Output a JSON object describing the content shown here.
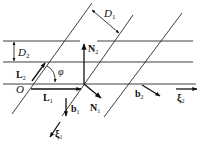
{
  "diagram": {
    "type": "geometric-vector-diagram",
    "labels": {
      "D1": {
        "main": "D",
        "sub": "1"
      },
      "D2": {
        "main": "D",
        "sub": "2"
      },
      "L1": {
        "main": "L",
        "sub": "1"
      },
      "L2": {
        "main": "L",
        "sub": "2"
      },
      "N1": {
        "main": "N",
        "sub": "1"
      },
      "N2": {
        "main": "N",
        "sub": "2"
      },
      "b1": {
        "main": "b",
        "sub": "1"
      },
      "b2": {
        "main": "b",
        "sub": "2"
      },
      "xi1": {
        "main": "ξ",
        "sub": "1"
      },
      "xi2": {
        "main": "ξ",
        "sub": "2"
      },
      "phi": "φ",
      "origin": "O"
    },
    "colors": {
      "line": "#2a2a2a",
      "vector": "#111111",
      "background": "#ffffff"
    },
    "horizontal_lines_y": [
      41,
      62,
      84
    ],
    "diagonal_lines": [
      {
        "x1": 92,
        "y1": 3,
        "x2": 12,
        "y2": 114
      },
      {
        "x1": 133,
        "y1": 15,
        "x2": 62,
        "y2": 116
      },
      {
        "x1": 182,
        "y1": 13,
        "x2": 104,
        "y2": 117
      }
    ]
  }
}
